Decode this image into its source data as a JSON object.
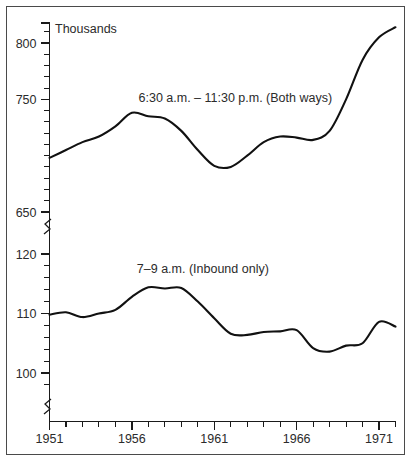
{
  "chart_data": {
    "type": "line",
    "title": "",
    "subtitle": "",
    "xlabel": "",
    "ylabel": "Thousands",
    "unit_label": "Thousands",
    "grid": false,
    "legend_position": "inline-annotations",
    "axis_break": true,
    "axis_break_note": "broken y-axis: upper panel 650-820 thousands, lower panel 97-122 thousands",
    "x": [
      1951,
      1952,
      1953,
      1954,
      1955,
      1956,
      1957,
      1958,
      1959,
      1960,
      1961,
      1962,
      1963,
      1964,
      1965,
      1966,
      1967,
      1968,
      1969,
      1970,
      1971,
      1972
    ],
    "xlim": [
      1951,
      1972
    ],
    "x_tick_labels": [
      "1951",
      "1956",
      "1961",
      "1966",
      "1971"
    ],
    "x_major_ticks": [
      1951,
      1956,
      1961,
      1966,
      1971
    ],
    "x_minor_tick_interval": 1,
    "y_upper_ticks_labeled": [
      "650",
      "750",
      "800"
    ],
    "y_upper_labeled_values": [
      650,
      750,
      800
    ],
    "y_lower_ticks_labeled": [
      "100",
      "110",
      "120"
    ],
    "y_lower_labeled_values": [
      100,
      110,
      120
    ],
    "y_minor_tick_interval_upper": 10,
    "y_minor_tick_interval_lower": 2,
    "ylim_upper": [
      645,
      822
    ],
    "ylim_lower": [
      96.5,
      122
    ],
    "series": [
      {
        "name": "6:30 a.m. – 11:30 p.m. (Both ways)",
        "label": "6:30 a.m. – 11:30 p.m. (Both ways)",
        "panel": "upper",
        "label_x": 1956.4,
        "label_y_px": 101,
        "values": [
          698,
          705,
          712,
          717,
          726,
          738,
          735,
          733,
          722,
          705,
          691,
          690,
          700,
          712,
          717,
          716,
          714,
          722,
          750,
          785,
          805,
          814
        ]
      },
      {
        "name": "7–9 a.m. (Inbound only)",
        "label": "7–9 a.m. (Inbound only)",
        "panel": "lower",
        "label_x": 1956.3,
        "label_y_px": 272,
        "values": [
          109.8,
          110.2,
          109.4,
          110.0,
          110.6,
          112.8,
          114.4,
          114.2,
          114.3,
          112.0,
          109.2,
          106.6,
          106.4,
          106.9,
          107.0,
          107.2,
          104.2,
          103.6,
          104.6,
          105.0,
          108.6,
          107.8
        ]
      }
    ]
  },
  "axis_geometry": {
    "plot_left_px": 48,
    "plot_right_px": 394,
    "upper_ref_value_a": 800,
    "upper_ref_px_a": 42,
    "upper_ref_value_b": 650,
    "upper_ref_px_b": 211,
    "lower_ref_value_a": 120,
    "lower_ref_px_a": 253,
    "lower_ref_value_b": 100,
    "lower_ref_px_b": 372,
    "x_axis_px": 420,
    "y_axis_top_px": 22,
    "break_upper_px": 228,
    "break_lower_px": 244,
    "bottom_break_upper_px": 396,
    "bottom_break_lower_px": 412
  }
}
